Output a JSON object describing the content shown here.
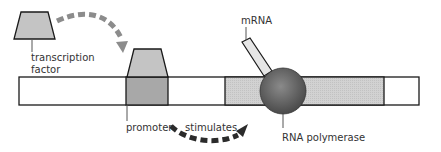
{
  "diagram": {
    "labels": {
      "transcription_factor_line1": "transcription",
      "transcription_factor_line2": "factor",
      "promoter": "promoter",
      "stimulates": "stimulates",
      "mrna": "mRNA",
      "rna_polymerase": "RNA polymerase"
    },
    "colors": {
      "dna_fill": "#ffffff",
      "promoter_fill": "#a8a8a8",
      "gene_fill": "#d6d6d6",
      "factor_fill": "#c4c4c4",
      "mrna_fill": "#e6e6e6",
      "polymerase": "#5a5a5a",
      "arrow_light": "#8c8c8c",
      "arrow_dark": "#2b2b2b",
      "outline": "#1a1a1a"
    }
  }
}
